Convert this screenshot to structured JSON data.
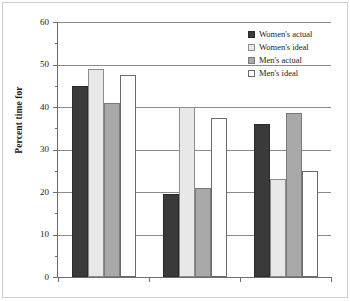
{
  "chart_data": {
    "type": "bar",
    "title": "",
    "subtitle": "",
    "xlabel": "",
    "ylabel": "Percent time for",
    "categories": [
      "Family",
      "Self",
      "Work"
    ],
    "series": [
      {
        "name": "Women's actual",
        "color": "#3a3a3a",
        "values": [
          45,
          19.5,
          36
        ]
      },
      {
        "name": "Women's ideal",
        "color": "#e8e8e8",
        "values": [
          49,
          40,
          23
        ]
      },
      {
        "name": "Men's actual",
        "color": "#a9a9a9",
        "values": [
          41,
          21,
          38.5
        ]
      },
      {
        "name": "Men's ideal",
        "color": "#ffffff",
        "values": [
          47.5,
          37.5,
          25
        ]
      }
    ],
    "ylim": [
      0,
      60
    ],
    "ytick_labels": [
      "0",
      "10",
      "20",
      "30",
      "40",
      "50",
      "60"
    ],
    "ytick_values": [
      0,
      10,
      20,
      30,
      40,
      50,
      60
    ],
    "yminor_values": [
      5,
      15,
      25,
      35,
      45,
      55
    ],
    "grid": true,
    "grid_axis": "y",
    "legend_position": "top-right",
    "legend_entries": [
      "Women's actual",
      "Women's ideal",
      "Men's actual",
      "Men's ideal"
    ]
  },
  "axis": {
    "y_title": "Percent time for",
    "y_ticks": [
      {
        "label": "60",
        "value": 60
      },
      {
        "label": "50",
        "value": 50
      },
      {
        "label": "40",
        "value": 40
      },
      {
        "label": "30",
        "value": 30
      },
      {
        "label": "20",
        "value": 20
      },
      {
        "label": "10",
        "value": 10
      },
      {
        "label": "0",
        "value": 0
      }
    ],
    "x_categories": [
      {
        "label": "Family"
      },
      {
        "label": "Self"
      },
      {
        "label": "Work"
      }
    ]
  },
  "legend": {
    "items": [
      {
        "label": "Women's actual",
        "swatch": "legend-swatch-womens-actual"
      },
      {
        "label": "Women's ideal",
        "swatch": "legend-swatch-womens-ideal"
      },
      {
        "label": "Men's actual",
        "swatch": "legend-swatch-mens-actual"
      },
      {
        "label": "Men's ideal",
        "swatch": "legend-swatch-mens-ideal"
      }
    ]
  }
}
